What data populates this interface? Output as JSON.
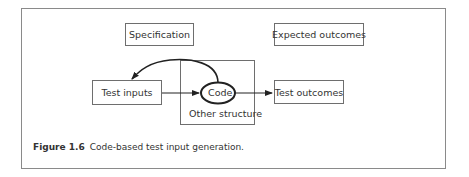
{
  "diagram": {
    "nodes": {
      "specification": "Specification",
      "expected_outcomes": "Expected outcomes",
      "test_inputs": "Test inputs",
      "code": "Code",
      "other_structure": "Other structure",
      "test_outcomes": "Test outcomes"
    },
    "edges": [
      {
        "from": "code",
        "to": "test_inputs",
        "style": "curved-arrow"
      },
      {
        "from": "test_inputs",
        "to": "code",
        "style": "arrow"
      },
      {
        "from": "code",
        "to": "test_outcomes",
        "style": "arrow"
      }
    ]
  },
  "caption": {
    "figure_number": "Figure 1.6",
    "text": "Code-based test input generation."
  },
  "colors": {
    "line": "#222222",
    "box_border": "#6e6e6e",
    "frame_border": "#8a8a8a",
    "text": "#333333"
  }
}
